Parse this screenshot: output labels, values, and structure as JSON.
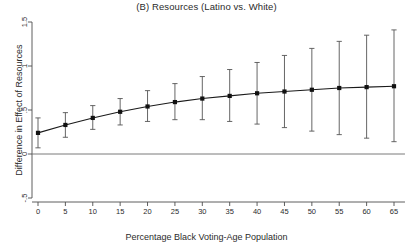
{
  "chart_data": {
    "type": "line",
    "title": "(B) Resources (Latino vs. White)",
    "subtitle": "",
    "xlabel": "Percentage Black Voting-Age Population",
    "ylabel": "Difference in Effect of Resources",
    "x": [
      0,
      5,
      10,
      15,
      20,
      25,
      30,
      35,
      40,
      45,
      50,
      55,
      60,
      65
    ],
    "values": [
      0.24,
      0.33,
      0.41,
      0.48,
      0.54,
      0.59,
      0.63,
      0.66,
      0.69,
      0.71,
      0.73,
      0.75,
      0.76,
      0.77
    ],
    "ci_lower": [
      0.07,
      0.19,
      0.28,
      0.33,
      0.37,
      0.39,
      0.39,
      0.37,
      0.34,
      0.3,
      0.26,
      0.22,
      0.18,
      0.14
    ],
    "ci_upper": [
      0.41,
      0.47,
      0.55,
      0.63,
      0.72,
      0.8,
      0.88,
      0.96,
      1.04,
      1.12,
      1.2,
      1.28,
      1.35,
      1.41
    ],
    "series": [
      {
        "name": "Difference in Effect of Resources",
        "values": [
          0.24,
          0.33,
          0.41,
          0.48,
          0.54,
          0.59,
          0.63,
          0.66,
          0.69,
          0.71,
          0.73,
          0.75,
          0.76,
          0.77
        ]
      }
    ],
    "xticks": [
      0,
      5,
      10,
      15,
      20,
      25,
      30,
      35,
      40,
      45,
      50,
      55,
      60,
      65
    ],
    "xtick_labels": [
      "0",
      "5",
      "10",
      "15",
      "20",
      "25",
      "30",
      "35",
      "40",
      "45",
      "50",
      "55",
      "60",
      "65"
    ],
    "yticks": [
      -0.5,
      0,
      0.5,
      1,
      1.5
    ],
    "ytick_labels": [
      "-.5",
      "0",
      ".5",
      "1",
      "1.5"
    ],
    "xlim": [
      -2,
      67
    ],
    "ylim": [
      -0.5,
      1.5
    ],
    "grid": false,
    "legend": false,
    "reference_line_y": 0,
    "marker": "square",
    "colors": {
      "line": "#1a1a1a",
      "marker": "#111111",
      "errorbar": "#555555",
      "axis": "#4d4d4d",
      "reference_line": "#6b6b6b",
      "background": "#ffffff"
    }
  }
}
